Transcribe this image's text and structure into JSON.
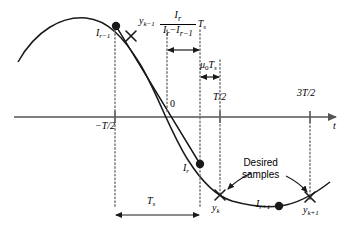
{
  "figure": {
    "axis": {
      "t_label": "t",
      "origin_label": "0",
      "ticks": [
        {
          "name": "minus-half-T",
          "label": "−T/2"
        },
        {
          "name": "half-T",
          "label": "T/2"
        },
        {
          "name": "three-half-T",
          "label": "3T/2"
        }
      ]
    },
    "points": [
      {
        "name": "I-r-minus-1",
        "label": "I",
        "sub": "r−1",
        "marker": "dot"
      },
      {
        "name": "y-k-minus-1",
        "label": "y",
        "sub": "k−1",
        "marker": "cross"
      },
      {
        "name": "I-r",
        "label": "I",
        "sub": "r",
        "marker": "dot"
      },
      {
        "name": "y-k",
        "label": "y",
        "sub": "k",
        "marker": "cross"
      },
      {
        "name": "I-r-plus-1",
        "label": "I",
        "sub": "r+1",
        "marker": "dot"
      },
      {
        "name": "y-k-plus-1",
        "label": "y",
        "sub": "k+1",
        "marker": "cross"
      }
    ],
    "measurements": [
      {
        "name": "interpolation-fraction",
        "numerator": "I",
        "numerator_sub": "r",
        "denominator": "I",
        "denominator_sub": "r",
        "denominator_tail": "−I",
        "denominator_tail_sub": "r−1",
        "multiplier": "T",
        "multiplier_sub": "s"
      },
      {
        "name": "mu-zero-Ts",
        "label": "μ",
        "label_sub": "0",
        "tail": "T",
        "tail_sub": "s"
      },
      {
        "name": "sample-period-Ts",
        "label": "T",
        "label_sub": "s"
      }
    ],
    "annotations": [
      {
        "name": "desired-samples-note",
        "line1": "Desired",
        "line2": "samples"
      }
    ],
    "colors": {
      "curve": "#1a1a1a",
      "axis": "#555555",
      "guide": "#6e6e6e",
      "text": "#000000"
    }
  }
}
